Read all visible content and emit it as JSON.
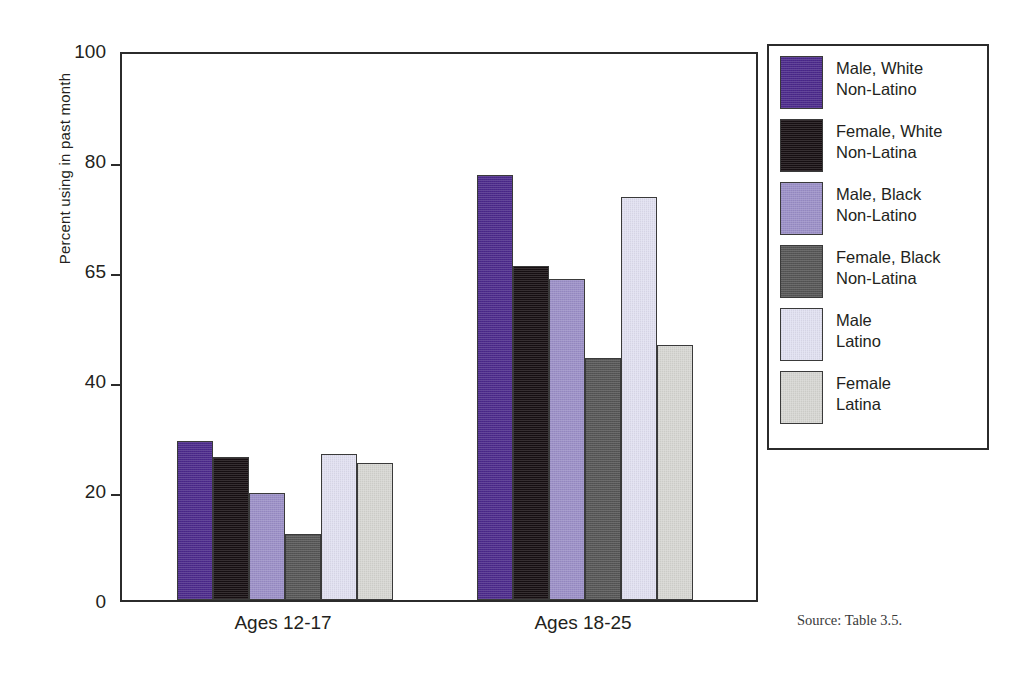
{
  "chart_data": {
    "type": "bar",
    "title": "",
    "xlabel": "",
    "ylabel": "Percent using in past month",
    "categories": [
      "Ages 12-17",
      "Ages 18-25"
    ],
    "yticks": [
      0,
      20,
      40,
      65,
      80,
      100
    ],
    "ylim": [
      0,
      100
    ],
    "grid": false,
    "axis_note": "y tick marks 0, 20, 40, 65, 80, 100 are drawn at equal pixel spacing (non-linear scale)",
    "legend_position": "right-outside-box",
    "series": [
      {
        "name": "Male, White\nNon-Latino",
        "color": "#4c2a8c",
        "values": [
          29,
          78
        ]
      },
      {
        "name": "Female, White\nNon-Latina",
        "color": "#170f12",
        "values": [
          26,
          65.5
        ]
      },
      {
        "name": "Male, Black\nNon-Latino",
        "color": "#9c90c8",
        "values": [
          19.5,
          63
        ]
      },
      {
        "name": "Female, Black\nNon-Latina",
        "color": "#565656",
        "values": [
          12,
          45
        ]
      },
      {
        "name": "Male\nLatino",
        "color": "#e2e1f2",
        "values": [
          26.5,
          75
        ]
      },
      {
        "name": "Female\nLatina",
        "color": "#d7d7d3",
        "values": [
          25,
          48
        ]
      }
    ],
    "annotations": [
      "Source: Table 3.5."
    ]
  },
  "axis": {
    "ylabel": "Percent using in past month",
    "ticks": [
      "100",
      "80",
      "65",
      "40",
      "20",
      "0"
    ],
    "categories": [
      "Ages 12-17",
      "Ages 18-25"
    ]
  },
  "legend": {
    "items": [
      {
        "label": "Male, White\nNon-Latino"
      },
      {
        "label": "Female, White\nNon-Latina"
      },
      {
        "label": "Male, Black\nNon-Latino"
      },
      {
        "label": "Female, Black\nNon-Latina"
      },
      {
        "label": "Male\nLatino"
      },
      {
        "label": "Female\nLatina"
      }
    ]
  },
  "footer": {
    "source": "Source: Table 3.5."
  }
}
